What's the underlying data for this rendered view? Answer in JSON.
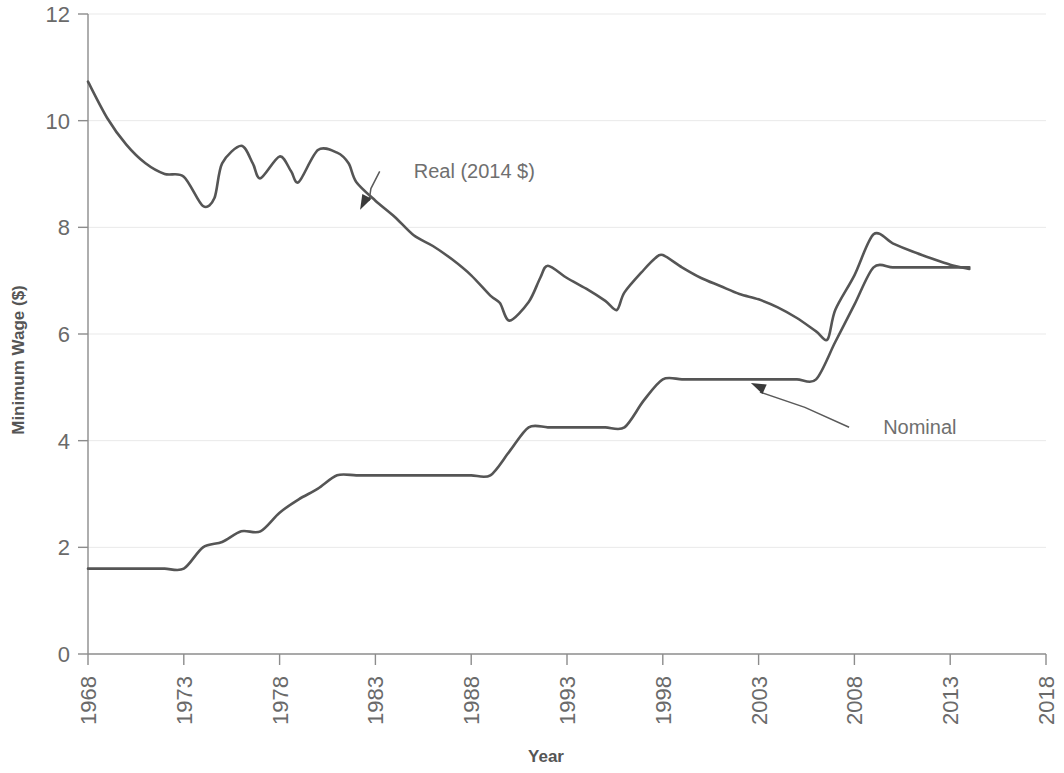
{
  "chart_data": {
    "type": "line",
    "title": "",
    "xlabel": "Year",
    "ylabel": "Minimum Wage ($)",
    "xlim": [
      1968,
      2018
    ],
    "ylim": [
      0,
      12
    ],
    "xticks": [
      1968,
      1973,
      1978,
      1983,
      1988,
      1993,
      1998,
      2003,
      2008,
      2013,
      2018
    ],
    "yticks": [
      0,
      2,
      4,
      6,
      8,
      10,
      12
    ],
    "xtick_labels": [
      "1968",
      "1973",
      "1978",
      "1983",
      "1988",
      "1993",
      "1998",
      "2003",
      "2008",
      "2013",
      "2018"
    ],
    "ytick_labels": [
      "0",
      "2",
      "4",
      "6",
      "8",
      "10",
      "12"
    ],
    "xtick_rotation": 90,
    "grid": true,
    "grid_axis": "y",
    "legend": "annotations",
    "line_color": "#555555",
    "grid_color": "#e9e9e9",
    "axis_color": "#8c8c8c",
    "annotations": [
      {
        "name": "real-series-annotation",
        "label": "Real (2014 $)",
        "text_x": 1985.0,
        "text_y": 9.05,
        "point_x": 1982.2,
        "point_y": 8.33
      },
      {
        "name": "nominal-series-annotation",
        "label": "Nominal",
        "text_x": 2009.5,
        "text_y": 4.25,
        "point_x": 2002.6,
        "point_y": 5.08
      }
    ],
    "series": [
      {
        "name": "Real (2014 $)",
        "label": "Real (2014 $)",
        "x": [
          1968,
          1969,
          1970,
          1971,
          1972,
          1973,
          1974,
          1974.6,
          1975,
          1976,
          1976.6,
          1977,
          1978,
          1978.6,
          1979,
          1980,
          1981,
          1981.6,
          1982,
          1983,
          1984,
          1985,
          1986,
          1987,
          1988,
          1989,
          1989.5,
          1990,
          1991,
          1991.6,
          1992,
          1993,
          1994,
          1995,
          1995.6,
          1996,
          1997,
          1997.6,
          1998,
          1999,
          2000,
          2001,
          2002,
          2003,
          2004,
          2005,
          2006,
          2006.6,
          2007,
          2008,
          2009,
          2010,
          2011,
          2012,
          2013,
          2014
        ],
        "y": [
          10.73,
          10.05,
          9.55,
          9.2,
          9.0,
          8.95,
          8.4,
          8.55,
          9.2,
          9.53,
          9.2,
          8.92,
          9.33,
          9.05,
          8.85,
          9.45,
          9.4,
          9.2,
          8.85,
          8.5,
          8.2,
          7.85,
          7.65,
          7.4,
          7.1,
          6.72,
          6.58,
          6.25,
          6.6,
          7.05,
          7.28,
          7.05,
          6.85,
          6.62,
          6.45,
          6.78,
          7.2,
          7.42,
          7.48,
          7.25,
          7.05,
          6.9,
          6.75,
          6.65,
          6.5,
          6.3,
          6.05,
          5.9,
          6.45,
          7.1,
          7.87,
          7.7,
          7.55,
          7.42,
          7.3,
          7.22
        ]
      },
      {
        "name": "Nominal",
        "label": "Nominal",
        "x": [
          1968,
          1969,
          1970,
          1971,
          1972,
          1973,
          1974,
          1975,
          1976,
          1977,
          1978,
          1979,
          1980,
          1981,
          1982,
          1983,
          1984,
          1985,
          1986,
          1987,
          1988,
          1989,
          1990,
          1991,
          1992,
          1993,
          1994,
          1995,
          1996,
          1997,
          1998,
          1999,
          2000,
          2001,
          2002,
          2003,
          2004,
          2005,
          2006,
          2007,
          2008,
          2009,
          2010,
          2011,
          2012,
          2013,
          2014
        ],
        "y": [
          1.6,
          1.6,
          1.6,
          1.6,
          1.6,
          1.6,
          2.0,
          2.1,
          2.3,
          2.3,
          2.65,
          2.9,
          3.1,
          3.35,
          3.35,
          3.35,
          3.35,
          3.35,
          3.35,
          3.35,
          3.35,
          3.35,
          3.8,
          4.25,
          4.25,
          4.25,
          4.25,
          4.25,
          4.25,
          4.75,
          5.15,
          5.15,
          5.15,
          5.15,
          5.15,
          5.15,
          5.15,
          5.15,
          5.15,
          5.85,
          6.55,
          7.25,
          7.25,
          7.25,
          7.25,
          7.25,
          7.25
        ]
      }
    ]
  },
  "axes": {
    "y_title": "Minimum Wage ($)",
    "x_title": "Year"
  }
}
